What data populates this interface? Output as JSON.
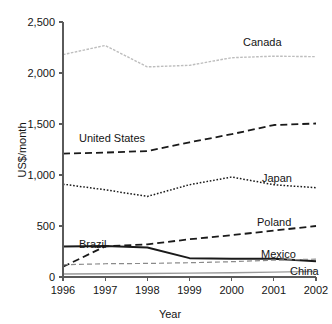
{
  "chart_data": {
    "type": "line",
    "title": "",
    "xlabel": "Year",
    "ylabel": "US$/month",
    "x": [
      1996,
      1997,
      1998,
      1999,
      2000,
      2001,
      2002
    ],
    "xtick_labels": [
      "1996",
      "1997",
      "1998",
      "1999",
      "2000",
      "2001",
      "2002"
    ],
    "ytick_labels": [
      "0",
      "500",
      "1,000",
      "1,500",
      "2,000",
      "2,500"
    ],
    "ytick_values": [
      0,
      500,
      1000,
      1500,
      2000,
      2500
    ],
    "ylim": [
      0,
      2500
    ],
    "xlim": [
      1996,
      2002
    ],
    "grid": false,
    "legend_position": "inline-right-of-series",
    "series": [
      {
        "name": "Canada",
        "label": "Canada",
        "values": [
          2180,
          2270,
          2060,
          2075,
          2150,
          2165,
          2160
        ],
        "color": "#bdbdbd",
        "style": "solid-dotted",
        "width": 1.4
      },
      {
        "name": "United States",
        "label": "United States",
        "values": [
          1210,
          1220,
          1235,
          1320,
          1400,
          1490,
          1505
        ],
        "color": "#1a1a1a",
        "style": "dashed",
        "width": 1.8
      },
      {
        "name": "Japan",
        "label": "Japan",
        "values": [
          910,
          855,
          790,
          905,
          980,
          905,
          875
        ],
        "color": "#1a1a1a",
        "style": "dotted",
        "width": 1.5
      },
      {
        "name": "Poland",
        "label": "Poland",
        "values": [
          100,
          300,
          320,
          370,
          410,
          455,
          500
        ],
        "color": "#1a1a1a",
        "style": "dashed",
        "width": 1.8
      },
      {
        "name": "Brazil",
        "label": "Brazil",
        "values": [
          300,
          305,
          290,
          185,
          180,
          178,
          155
        ],
        "color": "#1a1a1a",
        "style": "solid",
        "width": 2.0
      },
      {
        "name": "Mexico",
        "label": "Mexico",
        "values": [
          120,
          130,
          133,
          140,
          150,
          165,
          175
        ],
        "color": "#8a8a8a",
        "style": "dashed-thin",
        "width": 1.2
      },
      {
        "name": "China",
        "label": "China",
        "values": [
          30,
          32,
          35,
          38,
          42,
          48,
          55
        ],
        "color": "#9a9a9a",
        "style": "solid",
        "width": 1.4
      }
    ],
    "annotations": [
      {
        "name": "canada-label",
        "text": "Canada",
        "x": 243,
        "y": 46
      },
      {
        "name": "united-states-label",
        "text": "United States",
        "x": 79,
        "y": 142
      },
      {
        "name": "japan-label",
        "text": "Japan",
        "x": 262,
        "y": 182
      },
      {
        "name": "poland-label",
        "text": "Poland",
        "x": 257,
        "y": 226
      },
      {
        "name": "brazil-label",
        "text": "Brazil",
        "x": 79,
        "y": 248
      },
      {
        "name": "mexico-label",
        "text": "Mexico",
        "x": 261,
        "y": 258
      },
      {
        "name": "china-label",
        "text": "China",
        "x": 290,
        "y": 275
      }
    ]
  }
}
